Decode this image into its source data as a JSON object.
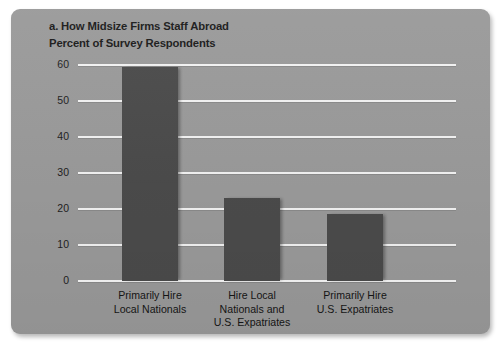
{
  "figure": {
    "panel_label": "a.",
    "title": "a. How Midsize Firms Staff Abroad",
    "subtitle": "Percent of Survey Respondents"
  },
  "chart_data": {
    "type": "bar",
    "title": "a. How Midsize Firms Staff Abroad",
    "subtitle": "Percent of Survey Respondents",
    "xlabel": "",
    "ylabel": "Percent of Survey Respondents",
    "ylim": [
      0,
      60
    ],
    "yticks": [
      0,
      10,
      20,
      30,
      40,
      50,
      60
    ],
    "ytick_labels": [
      "0",
      "10",
      "20",
      "30",
      "40",
      "50",
      "60"
    ],
    "grid": true,
    "legend": "none",
    "bar_color": "#4b4b4b",
    "background_color": "#9a9a9a",
    "gridline_color": "#f2f2f2",
    "categories": [
      "Primarily Hire Local Nationals",
      "Hire Local Nationals and U.S. Expatriates",
      "Primarily Hire U.S. Expatriates"
    ],
    "category_lines": [
      [
        "Primarily Hire",
        "Local Nationals"
      ],
      [
        "Hire Local",
        "Nationals and",
        "U.S. Expatriates"
      ],
      [
        "Primarily Hire",
        "U.S. Expatriates"
      ]
    ],
    "values": [
      59.5,
      23,
      18.5
    ]
  }
}
